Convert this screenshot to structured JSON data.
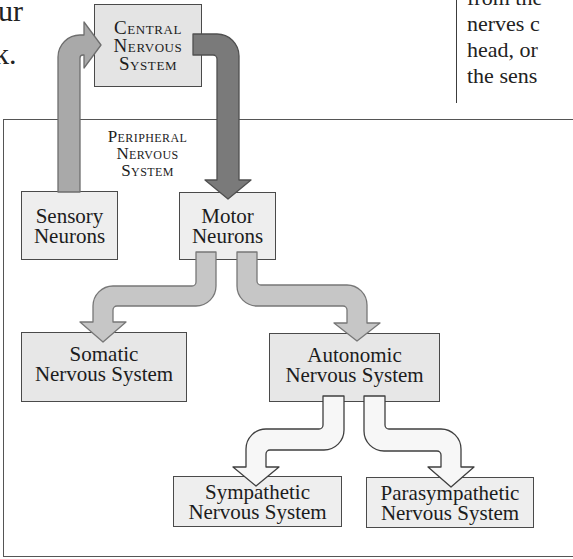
{
  "page_fragments": {
    "left_column_lines": [
      "ur",
      "k."
    ],
    "right_column_lines": [
      "from the",
      "nerves c",
      "head, or",
      "the sens"
    ]
  },
  "diagram": {
    "central": {
      "lines": [
        "Central",
        "Nervous",
        "System"
      ]
    },
    "peripheral_label": {
      "lines": [
        "Peripheral",
        "Nervous",
        "System"
      ]
    },
    "nodes": {
      "sensory": {
        "lines": [
          "Sensory",
          "Neurons"
        ]
      },
      "motor": {
        "lines": [
          "Motor",
          "Neurons"
        ]
      },
      "somatic": {
        "lines": [
          "Somatic",
          "Nervous System"
        ]
      },
      "autonomic": {
        "lines": [
          "Autonomic",
          "Nervous System"
        ]
      },
      "sympathetic": {
        "lines": [
          "Sympathetic",
          "Nervous System"
        ]
      },
      "parasympathetic": {
        "lines": [
          "Parasympathetic",
          "Nervous System"
        ]
      }
    },
    "edges": [
      {
        "from": "Sensory Neurons",
        "to": "Central Nervous System",
        "style": "medium-gray"
      },
      {
        "from": "Central Nervous System",
        "to": "Motor Neurons",
        "style": "dark-gray"
      },
      {
        "from": "Motor Neurons",
        "to": "Somatic Nervous System",
        "style": "light-gray"
      },
      {
        "from": "Motor Neurons",
        "to": "Autonomic Nervous System",
        "style": "light-gray"
      },
      {
        "from": "Autonomic Nervous System",
        "to": "Sympathetic Nervous System",
        "style": "white"
      },
      {
        "from": "Autonomic Nervous System",
        "to": "Parasympathetic Nervous System",
        "style": "white"
      }
    ],
    "colors": {
      "arrow_medium": "#a9a9a9",
      "arrow_dark": "#7a7a7a",
      "arrow_light": "#c6c6c6",
      "arrow_white": "#f7f7f7",
      "box_fill": "#e7e7e7",
      "box_border": "#4a4a4a"
    }
  }
}
